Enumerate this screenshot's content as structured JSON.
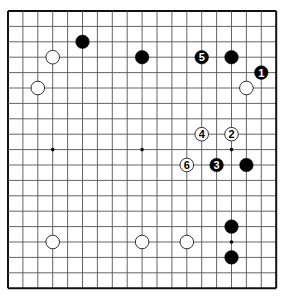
{
  "board": {
    "size": 19,
    "origin_x": 8,
    "origin_y": 11,
    "spacing_x": 14.9,
    "spacing_y": 15.4,
    "line_color": "#555555",
    "border_color": "#111111",
    "hoshi": [
      [
        3,
        9
      ],
      [
        9,
        9
      ],
      [
        15,
        9
      ],
      [
        15,
        15
      ],
      [
        9,
        3
      ],
      [
        3,
        15
      ],
      [
        9,
        15
      ],
      [
        15,
        3
      ],
      [
        3,
        3
      ],
      [
        9,
        9
      ]
    ],
    "visible_hoshi": [
      [
        3,
        9
      ],
      [
        9,
        9
      ],
      [
        15,
        9
      ],
      [
        15,
        15
      ]
    ]
  },
  "stones": [
    {
      "color": "black",
      "col": 5,
      "row": 2,
      "label": ""
    },
    {
      "color": "white",
      "col": 3,
      "row": 3,
      "label": ""
    },
    {
      "color": "white",
      "col": 2,
      "row": 5,
      "label": ""
    },
    {
      "color": "black",
      "col": 9,
      "row": 3,
      "label": ""
    },
    {
      "color": "black",
      "col": 13,
      "row": 3,
      "label": "5"
    },
    {
      "color": "black",
      "col": 15,
      "row": 3,
      "label": ""
    },
    {
      "color": "black",
      "col": 17,
      "row": 4,
      "label": "1"
    },
    {
      "color": "white",
      "col": 16,
      "row": 5,
      "label": ""
    },
    {
      "color": "white",
      "col": 13,
      "row": 8,
      "label": "4"
    },
    {
      "color": "white",
      "col": 15,
      "row": 8,
      "label": "2"
    },
    {
      "color": "white",
      "col": 12,
      "row": 10,
      "label": "6"
    },
    {
      "color": "black",
      "col": 14,
      "row": 10,
      "label": "3"
    },
    {
      "color": "black",
      "col": 16,
      "row": 10,
      "label": ""
    },
    {
      "color": "white",
      "col": 3,
      "row": 15,
      "label": ""
    },
    {
      "color": "white",
      "col": 9,
      "row": 15,
      "label": ""
    },
    {
      "color": "white",
      "col": 12,
      "row": 15,
      "label": ""
    },
    {
      "color": "black",
      "col": 15,
      "row": 14,
      "label": ""
    },
    {
      "color": "black",
      "col": 15,
      "row": 16,
      "label": ""
    }
  ]
}
